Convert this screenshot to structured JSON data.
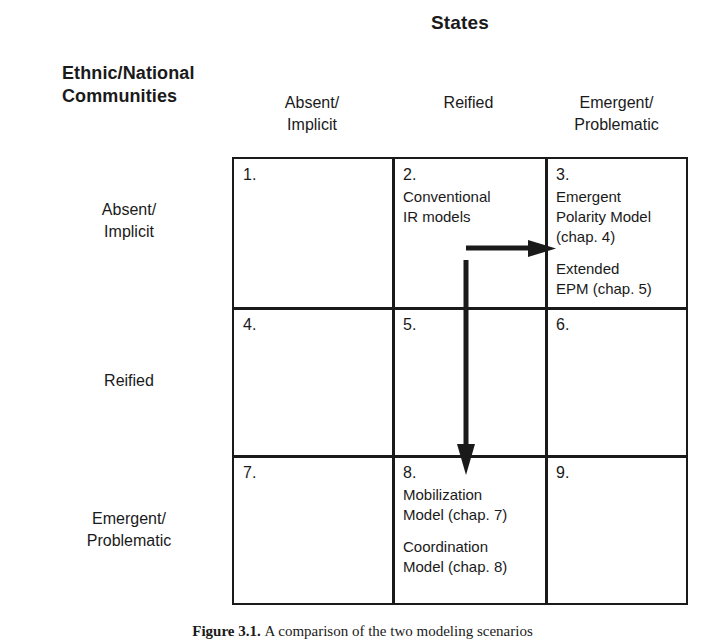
{
  "figure": {
    "column_group_title": "States",
    "row_group_title_line1": "Ethnic/National",
    "row_group_title_line2": "Communities",
    "column_headers": [
      {
        "line1": "Absent/",
        "line2": "Implicit"
      },
      {
        "line1": "Reified",
        "line2": ""
      },
      {
        "line1": "Emergent/",
        "line2": "Problematic"
      }
    ],
    "row_headers": [
      {
        "line1": "Absent/",
        "line2": "Implicit"
      },
      {
        "line1": "Reified",
        "line2": ""
      },
      {
        "line1": "Emergent/",
        "line2": "Problematic"
      }
    ],
    "cells": [
      {
        "number": "1.",
        "lines": []
      },
      {
        "number": "2.",
        "lines": [
          "Conventional",
          "IR models"
        ]
      },
      {
        "number": "3.",
        "lines": [
          "Emergent",
          "Polarity  Model",
          "(chap. 4)",
          "",
          "Extended",
          "EPM  (chap. 5)"
        ]
      },
      {
        "number": "4.",
        "lines": []
      },
      {
        "number": "5.",
        "lines": []
      },
      {
        "number": "6.",
        "lines": []
      },
      {
        "number": "7.",
        "lines": []
      },
      {
        "number": "8.",
        "lines": [
          "Mobilization",
          "Model (chap. 7)",
          "",
          "Coordination",
          "Model (chap. 8)"
        ]
      },
      {
        "number": "9.",
        "lines": []
      }
    ],
    "arrows": [
      {
        "name": "arrow-right-to-cell-3",
        "direction": "right"
      },
      {
        "name": "arrow-down-to-cell-8",
        "direction": "down"
      }
    ],
    "caption": {
      "figure_number": "Figure 3.1.",
      "text": "A comparison of the two modeling scenarios"
    },
    "colors": {
      "ink": "#1a1a1a",
      "page": "#ffffff"
    }
  }
}
